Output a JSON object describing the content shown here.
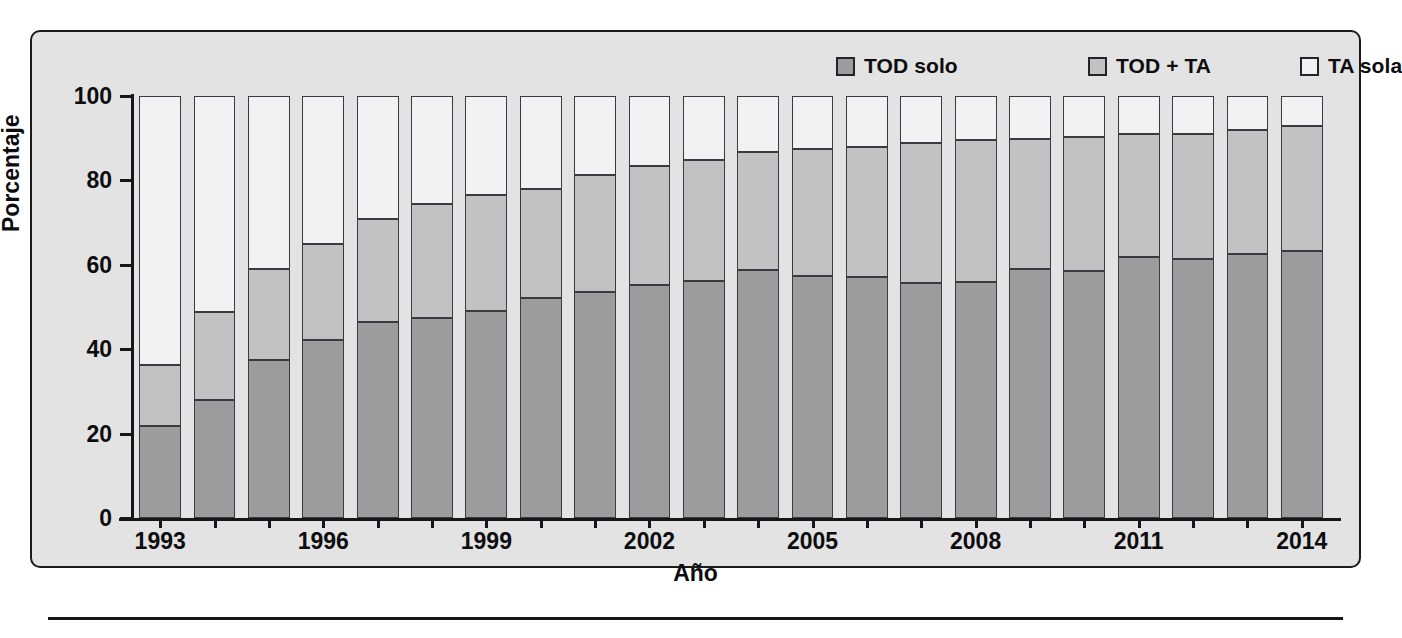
{
  "legend": {
    "items": [
      {
        "label": "TOD solo",
        "color": "#9c9c9c",
        "icon": "square-swatch-icon"
      },
      {
        "label": "TOD + TA",
        "color": "#c2c2c2",
        "icon": "square-swatch-icon"
      },
      {
        "label": "TA sola",
        "color": "#f2f2f2",
        "icon": "square-swatch-icon"
      }
    ]
  },
  "axes": {
    "y_title": "Porcentaje",
    "x_title": "Año",
    "y_ticks": [
      "0",
      "20",
      "40",
      "60",
      "80",
      "100"
    ],
    "x_ticks": [
      "1993",
      "1996",
      "1999",
      "2002",
      "2005",
      "2008",
      "2011",
      "2014"
    ]
  },
  "chart_data": {
    "type": "bar",
    "stacked": true,
    "title": "",
    "xlabel": "Año",
    "ylabel": "Porcentaje",
    "ylim": [
      0,
      100
    ],
    "grid": false,
    "legend_position": "top-right",
    "categories": [
      "1993",
      "1994",
      "1995",
      "1996",
      "1997",
      "1998",
      "1999",
      "2000",
      "2001",
      "2002",
      "2003",
      "2004",
      "2005",
      "2006",
      "2007",
      "2008",
      "2009",
      "2010",
      "2011",
      "2012",
      "2013",
      "2014"
    ],
    "tick_labels": [
      "1993",
      "",
      "",
      "1996",
      "",
      "",
      "1999",
      "",
      "",
      "2002",
      "",
      "",
      "2005",
      "",
      "",
      "2008",
      "",
      "",
      "2011",
      "",
      "",
      "2014"
    ],
    "series": [
      {
        "name": "TOD solo",
        "color": "#9c9c9c",
        "values": [
          21.8,
          27.9,
          37.4,
          42.3,
          46.5,
          47.3,
          49.0,
          52.2,
          53.5,
          55.2,
          56.1,
          58.8,
          57.4,
          57.1,
          55.8,
          56.0,
          58.9,
          58.6,
          61.8,
          61.3,
          62.6,
          63.3
        ]
      },
      {
        "name": "TOD + TA",
        "color": "#c2c2c2",
        "values": [
          14.5,
          21.0,
          21.7,
          22.6,
          24.3,
          27.0,
          27.6,
          25.8,
          27.7,
          28.2,
          28.8,
          28.0,
          30.0,
          30.8,
          33.1,
          33.5,
          30.9,
          31.7,
          29.3,
          29.6,
          29.3,
          29.6
        ]
      },
      {
        "name": "TA sola",
        "color": "#f2f2f2",
        "values": [
          63.7,
          51.1,
          40.9,
          35.1,
          29.2,
          25.7,
          23.4,
          22.0,
          18.8,
          16.6,
          15.1,
          13.2,
          12.6,
          12.1,
          11.1,
          10.5,
          10.2,
          9.7,
          8.9,
          9.1,
          8.1,
          7.1
        ]
      }
    ]
  }
}
